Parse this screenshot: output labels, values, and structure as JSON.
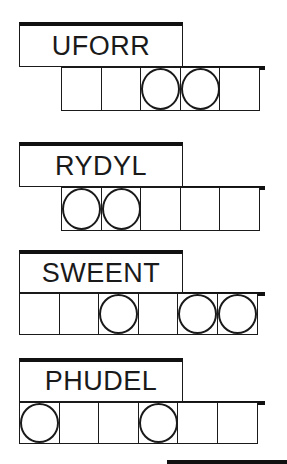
{
  "puzzles": [
    {
      "word": "UFORR",
      "label_top": 22,
      "label_height": 45,
      "boxes_left": 61,
      "boxes_top": 67,
      "box_height": 44,
      "cells": 5,
      "circled": [
        2,
        3
      ]
    },
    {
      "word": "RYDYL",
      "label_top": 142,
      "label_height": 45,
      "boxes_left": 61,
      "boxes_top": 187,
      "box_height": 44,
      "cells": 5,
      "circled": [
        0,
        1
      ]
    },
    {
      "word": "SWEENT",
      "label_top": 250,
      "label_height": 43,
      "boxes_left": 19,
      "boxes_top": 293,
      "box_height": 42,
      "cells": 6,
      "circled": [
        2,
        4,
        5
      ]
    },
    {
      "word": "PHUDEL",
      "label_top": 358,
      "label_height": 44,
      "boxes_left": 19,
      "boxes_top": 402,
      "box_height": 42,
      "cells": 6,
      "circled": [
        0,
        3
      ]
    }
  ],
  "colors": {
    "ink": "#1a1a1a",
    "background": "#ffffff"
  }
}
